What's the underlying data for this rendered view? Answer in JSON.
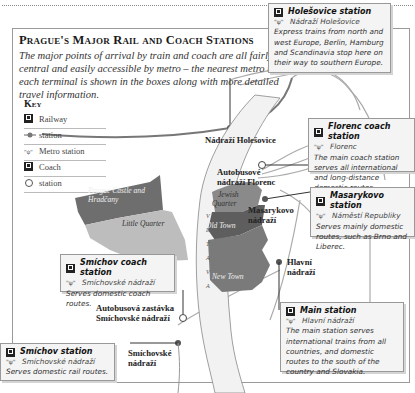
{
  "title": "Prague's Major Rail and Coach Stations",
  "intro": "The major points of arrival by train and coach are all fairly central and easily accessible by metro – the nearest metro to each terminal is shown in the boxes along with more detailed travel information.",
  "key": {
    "title": "Key",
    "items": [
      {
        "icon": "railway-icon",
        "label": "Railway"
      },
      {
        "icon": "railway-station-dot-icon",
        "label": "station"
      },
      {
        "icon": "metro-icon",
        "label": "Metro station"
      },
      {
        "icon": "coach-icon",
        "label": "Coach"
      },
      {
        "icon": "coach-station-circle-icon",
        "label": "station"
      }
    ]
  },
  "boxes": {
    "holesovice": {
      "title": "Holešovice station",
      "metro": "Nádraží Holešovice",
      "desc": "Express trains from north and west Europe, Berlin, Hamburg and Scandinavia stop here on their way to southern Europe."
    },
    "florenc": {
      "title": "Florenc coach station",
      "metro": "Florenc",
      "desc": "The main coach station serves all international and long-distance domestic routes."
    },
    "masarykovo": {
      "title": "Masarykovo station",
      "metro": "Náměstí Republiky",
      "desc": "Serves mainly domestic routes, such as Brno and Liberec."
    },
    "smichov_coach": {
      "title": "Smíchov coach station",
      "metro": "Smíchovské nádraží",
      "desc": "Serves domestic coach routes."
    },
    "main": {
      "title": "Main station",
      "metro": "Hlavní nádraží",
      "desc": "The main station serves international trains from all countries, and domestic routes to the south of the country and Slovakia."
    },
    "smichov": {
      "title": "Smíchov station",
      "metro": "Smíchovské nádraží",
      "desc": "Serves domestic rail routes."
    }
  },
  "map_labels": {
    "holesovice": "Nádraží Holešovice",
    "florenc_1": "Autobusové",
    "florenc_2": "nádraží Florenc",
    "masarykovo_1": "Masarykovo",
    "masarykovo_2": "nádraží",
    "hlavni_1": "Hlavní",
    "hlavni_2": "nádraží",
    "smichov_coach_1": "Autobusová zastávka",
    "smichov_coach_2": "Smíchovské nádraží",
    "smichov_1": "Smíchovské",
    "smichov_2": "nádraží"
  },
  "districts": {
    "castle_1": "Prague Castle and",
    "castle_2": "Hradčany",
    "little_quarter": "Little Quarter",
    "jewish_1": "Jewish",
    "jewish_2": "Quarter",
    "old_town": "Old Town",
    "new_town": "New Town",
    "river": "VLTAVA"
  },
  "colors": {
    "castle": "#6e6e6e",
    "little_quarter": "#bdbdbd",
    "jewish": "#8a8a8a",
    "old_town": "#5e5e5e",
    "new_town": "#7a7a7a",
    "river": "#f0f0f0"
  }
}
